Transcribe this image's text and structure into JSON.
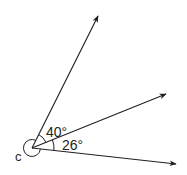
{
  "diagram": {
    "type": "angles-at-point",
    "vertex": {
      "label": "c"
    },
    "rays": [
      {
        "name": "upper-ray",
        "direction": "up-right steep"
      },
      {
        "name": "middle-ray",
        "direction": "right, rising"
      },
      {
        "name": "lower-ray",
        "direction": "right, slightly descending"
      }
    ],
    "angles": [
      {
        "name": "angle-upper",
        "between": [
          "upper-ray",
          "middle-ray"
        ],
        "label": "40°",
        "value_deg": 40
      },
      {
        "name": "angle-lower",
        "between": [
          "middle-ray",
          "lower-ray"
        ],
        "label": "26°",
        "value_deg": 26
      },
      {
        "name": "reflex-angle-c",
        "between": [
          "lower-ray",
          "upper-ray"
        ],
        "label": "",
        "marked": true
      }
    ],
    "colors": {
      "ink": "#231f20",
      "background": "#ffffff"
    }
  }
}
